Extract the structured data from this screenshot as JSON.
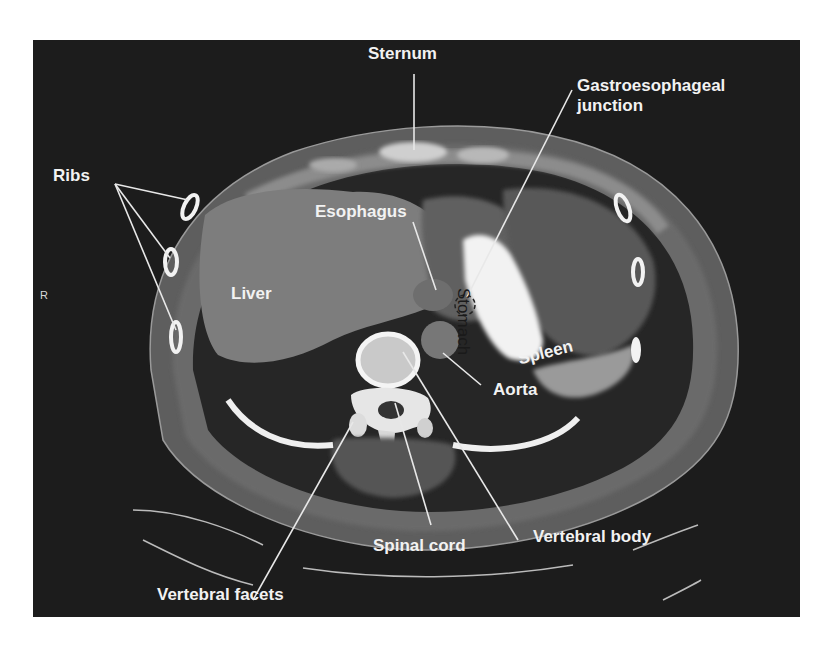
{
  "figure": {
    "type": "axial CT scan, upper abdomen",
    "orientation_marker": "R",
    "labels": {
      "sternum": "Sternum",
      "ge_junction_line1": "Gastroesophageal",
      "ge_junction_line2": "junction",
      "ribs": "Ribs",
      "esophagus": "Esophagus",
      "stomach": "Stomach",
      "liver": "Liver",
      "spleen": "Spleen",
      "aorta": "Aorta",
      "vertebral_body": "Vertebral body",
      "spinal_cord": "Spinal cord",
      "vertebral_facets": "Vertebral facets"
    },
    "colors": {
      "background": "#1c1c1c",
      "label_text": "#f2f2f2",
      "leader_lines": "#e8e8e8",
      "bone": "#f0f0f0",
      "liver": "#7a7a7a",
      "stomach_contrast": "#f4f4f4"
    }
  }
}
